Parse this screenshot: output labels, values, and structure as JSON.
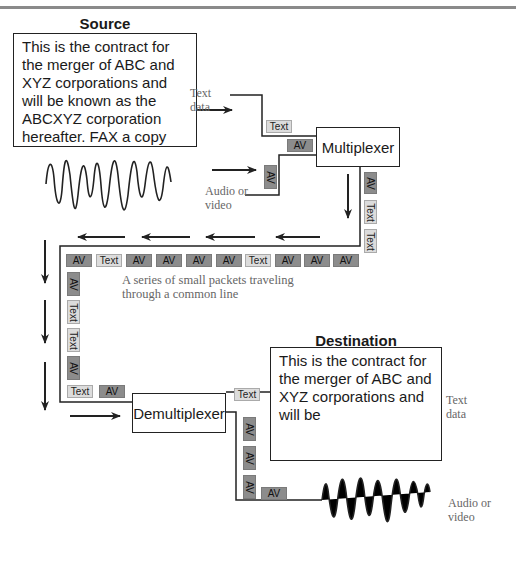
{
  "source": {
    "heading": "Source",
    "document_text": "This is the contract for the merger of ABC and XYZ corporations and will be known as the ABCXYZ corporation hereafter. FAX a copy"
  },
  "destination": {
    "heading": "Destination",
    "document_text": "This is the contract for the merger of ABC and XYZ corporations and will be"
  },
  "labels": {
    "text_data_in_line1": "Text",
    "text_data_in_line2": "data",
    "audio_video_in_line1": "Audio or",
    "audio_video_in_line2": "video",
    "text_data_out_line1": "Text",
    "text_data_out_line2": "data",
    "audio_video_out_line1": "Audio or",
    "audio_video_out_line2": "video",
    "caption_line1": "A series of small packets traveling",
    "caption_line2": "through a common line"
  },
  "components": {
    "multiplexer": "Multiplexer",
    "demultiplexer": "Demultiplexer"
  },
  "packets": {
    "text_input": "Text",
    "av_input_horizontal": "AV",
    "av_input_vertical": "AV",
    "mux_out_vertical": [
      "AV",
      "Text",
      "Text"
    ],
    "common_line_row": [
      "AV",
      "Text",
      "AV",
      "AV",
      "AV",
      "AV",
      "Text",
      "AV",
      "AV",
      "AV"
    ],
    "left_column": [
      "AV",
      "Text",
      "Text",
      "AV"
    ],
    "bottom_row": [
      "Text",
      "AV"
    ],
    "demux_text_out": "Text",
    "demux_av_vertical": [
      "AV",
      "AV",
      "AV"
    ],
    "demux_av_horizontal": "AV"
  },
  "colors": {
    "av_packet": "#8c8c8c",
    "text_packet": "#dcdcdc",
    "line": "#222222",
    "label_gray": "#666666"
  }
}
